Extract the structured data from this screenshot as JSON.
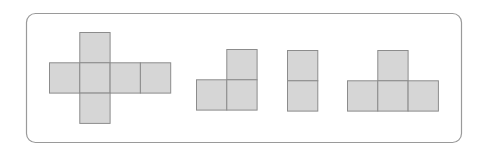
{
  "figure": {
    "colors": {
      "square_fill": "#d6d6d6",
      "square_stroke": "#8c8c8c",
      "frame_stroke": "#9a9a9a",
      "background": "#ffffff"
    },
    "shapes": [
      {
        "name": "cross-net",
        "cells": [
          [
            1,
            0
          ],
          [
            0,
            1
          ],
          [
            1,
            1
          ],
          [
            2,
            1
          ],
          [
            3,
            1
          ],
          [
            1,
            2
          ]
        ]
      },
      {
        "name": "l-tromino",
        "cells": [
          [
            1,
            0
          ],
          [
            0,
            1
          ],
          [
            1,
            1
          ]
        ]
      },
      {
        "name": "vertical-domino",
        "cells": [
          [
            0,
            0
          ],
          [
            0,
            1
          ]
        ]
      },
      {
        "name": "t-tetromino",
        "cells": [
          [
            1,
            0
          ],
          [
            0,
            1
          ],
          [
            1,
            1
          ],
          [
            2,
            1
          ]
        ]
      }
    ]
  }
}
